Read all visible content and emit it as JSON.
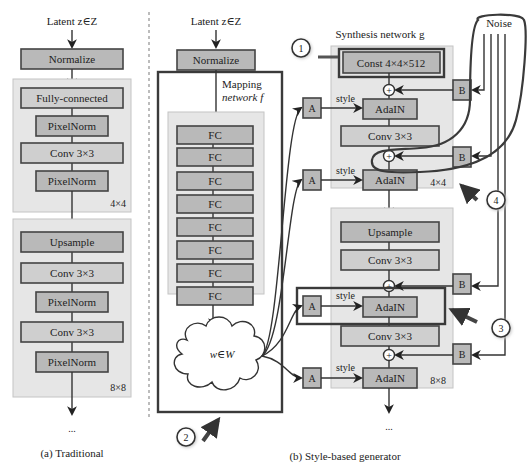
{
  "traditional": {
    "latent_label": "Latent z∈Z",
    "normalize": "Normalize",
    "block4": {
      "layers": [
        "Fully-connected",
        "PixelNorm",
        "Conv 3×3",
        "PixelNorm"
      ],
      "resolution": "4×4"
    },
    "block8": {
      "layers": [
        "Upsample",
        "Conv 3×3",
        "PixelNorm",
        "Conv 3×3",
        "PixelNorm"
      ],
      "resolution": "8×8"
    },
    "ellipsis": "...",
    "caption": "(a) Traditional"
  },
  "style_based": {
    "latent_label": "Latent z∈Z",
    "normalize": "Normalize",
    "mapping": {
      "title_line1": "Mapping",
      "title_line2": "network f",
      "layers": [
        "FC",
        "FC",
        "FC",
        "FC",
        "FC",
        "FC",
        "FC",
        "FC"
      ],
      "output": "w∈W"
    },
    "synthesis": {
      "title": "Synthesis network g",
      "const": "Const 4×4×512",
      "block4": {
        "layers": [
          "AdaIN",
          "Conv 3×3",
          "AdaIN"
        ],
        "resolution": "4×4"
      },
      "block8": {
        "layers": [
          "Upsample",
          "Conv 3×3",
          "AdaIN",
          "Conv 3×3",
          "AdaIN"
        ],
        "resolution": "8×8"
      },
      "style_label": "style",
      "affine_label": "A",
      "noise_scale_label": "B",
      "add_symbol": "+",
      "ellipsis": "..."
    },
    "noise_label": "Noise",
    "caption": "(b) Style-based generator"
  },
  "annotations": [
    "1",
    "2",
    "3",
    "4"
  ],
  "colors": {
    "dark_box": "#b9b9b9",
    "light_box": "#cfcfcf",
    "panel": "#e6e6e6",
    "stroke": "#444444",
    "highlight": "#3a3a3a"
  }
}
